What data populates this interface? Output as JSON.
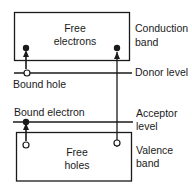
{
  "diagram": {
    "conduction_band": {
      "inner_label_1": "Free",
      "inner_label_2": "electrons",
      "side_label_1": "Conduction",
      "side_label_2": "band"
    },
    "donor": {
      "label": "Donor level",
      "bound_label": "Bound hole"
    },
    "acceptor": {
      "label_1": "Acceptor",
      "label_2": "level",
      "bound_label": "Bound electron"
    },
    "valence_band": {
      "inner_label_1": "Free",
      "inner_label_2": "holes",
      "side_label_1": "Valence",
      "side_label_2": "band"
    },
    "colors": {
      "line": "#1a1a1a",
      "background": "#ffffff"
    }
  }
}
